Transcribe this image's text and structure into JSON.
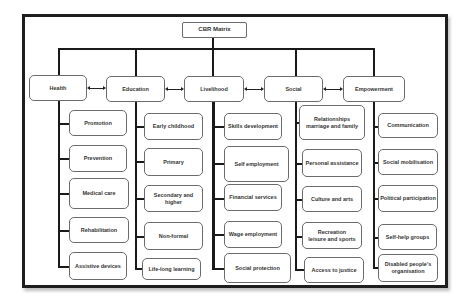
{
  "diagram": {
    "title": "CBR Matrix",
    "components": [
      {
        "label": "Health",
        "elements": [
          "Promotion",
          "Prevention",
          "Medical care",
          "Rehabilitation",
          "Assistive devices"
        ]
      },
      {
        "label": "Education",
        "elements": [
          "Early childhood",
          "Primary",
          "Secondary and higher",
          "Non-formal",
          "Life-long learning"
        ]
      },
      {
        "label": "Livelihood",
        "elements": [
          "Skills development",
          "Self employment",
          "Financial services",
          "Wage employment",
          "Social protection"
        ]
      },
      {
        "label": "Social",
        "elements": [
          "Relationships\nmarriage and family",
          "Personal assistance",
          "Culture and arts",
          "Recreation\nleisure and sports",
          "Access to justice"
        ]
      },
      {
        "label": "Empowerment",
        "elements": [
          "Communication",
          "Social mobilisation",
          "Political participation",
          "Self-help groups",
          "Disabled people's\norganisation"
        ]
      }
    ],
    "colors": {
      "border": "#1e1e1e",
      "box_border": "#6b6b6b",
      "text": "#333333",
      "background": "#ffffff"
    }
  }
}
